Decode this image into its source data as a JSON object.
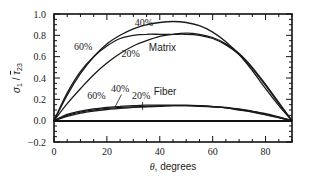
{
  "chart_data": {
    "type": "line",
    "title": "",
    "xlabel": "θ, degrees",
    "ylabel": "σ1/τ̄23",
    "xlim": [
      0,
      90
    ],
    "ylim": [
      -0.2,
      1.0
    ],
    "x_ticks": [
      0,
      20,
      40,
      60,
      80
    ],
    "y_ticks": [
      -0.2,
      0.0,
      0.2,
      0.4,
      0.6,
      0.8,
      1.0
    ],
    "y_tick_labels": [
      "−0.2",
      "0.0",
      "0.2",
      "0.4",
      "0.6",
      "0.8",
      "1.0"
    ],
    "grid": false,
    "legend": "inline labels",
    "x": [
      0,
      5,
      10,
      15,
      20,
      25,
      30,
      35,
      40,
      45,
      50,
      55,
      60,
      65,
      70,
      75,
      80,
      85,
      90
    ],
    "series": [
      {
        "name": "Matrix 40%",
        "group": "Matrix",
        "label": "40%",
        "values": [
          0.0,
          0.24,
          0.44,
          0.6,
          0.72,
          0.8,
          0.86,
          0.9,
          0.92,
          0.93,
          0.92,
          0.89,
          0.83,
          0.74,
          0.62,
          0.47,
          0.3,
          0.14,
          0.0
        ]
      },
      {
        "name": "Matrix 60%",
        "group": "Matrix",
        "label": "60%",
        "values": [
          0.0,
          0.26,
          0.46,
          0.6,
          0.7,
          0.77,
          0.8,
          0.81,
          0.81,
          0.81,
          0.81,
          0.8,
          0.77,
          0.71,
          0.62,
          0.49,
          0.33,
          0.16,
          0.0
        ]
      },
      {
        "name": "Matrix 20%",
        "group": "Matrix",
        "label": "20%",
        "values": [
          0.0,
          0.16,
          0.3,
          0.43,
          0.54,
          0.63,
          0.7,
          0.75,
          0.79,
          0.81,
          0.82,
          0.81,
          0.78,
          0.72,
          0.63,
          0.5,
          0.34,
          0.17,
          0.0
        ]
      },
      {
        "name": "Fiber 60%",
        "group": "Fiber",
        "label": "60%",
        "values": [
          0.0,
          0.06,
          0.09,
          0.11,
          0.125,
          0.135,
          0.14,
          0.145,
          0.145,
          0.145,
          0.145,
          0.14,
          0.13,
          0.12,
          0.105,
          0.085,
          0.06,
          0.03,
          0.0
        ]
      },
      {
        "name": "Fiber 40%",
        "group": "Fiber",
        "label": "40%",
        "values": [
          0.0,
          0.05,
          0.08,
          0.1,
          0.115,
          0.125,
          0.13,
          0.135,
          0.14,
          0.14,
          0.14,
          0.135,
          0.13,
          0.12,
          0.1,
          0.08,
          0.055,
          0.028,
          0.0
        ]
      },
      {
        "name": "Fiber 20%",
        "group": "Fiber",
        "label": "20%",
        "values": [
          0.0,
          0.04,
          0.07,
          0.09,
          0.105,
          0.115,
          0.125,
          0.13,
          0.135,
          0.14,
          0.14,
          0.14,
          0.135,
          0.125,
          0.11,
          0.09,
          0.065,
          0.035,
          0.0
        ]
      }
    ],
    "annotations": [
      {
        "text": "Matrix",
        "x": 41,
        "y": 0.65
      },
      {
        "text": "Fiber",
        "x": 42,
        "y": 0.24
      },
      {
        "text": "40%",
        "x": 34,
        "y": 0.89,
        "series": "Matrix 40%"
      },
      {
        "text": "60%",
        "x": 11,
        "y": 0.66,
        "series": "Matrix 60%"
      },
      {
        "text": "20%",
        "x": 29,
        "y": 0.6,
        "series": "Matrix 20%"
      },
      {
        "text": "60%",
        "x": 16,
        "y": 0.2,
        "series": "Fiber 60%"
      },
      {
        "text": "40%",
        "x": 25,
        "y": 0.27,
        "series": "Fiber 40%"
      },
      {
        "text": "20%",
        "x": 33,
        "y": 0.2,
        "series": "Fiber 20%"
      }
    ]
  },
  "colors": {
    "line": "#1a1a1a",
    "axis": "#111111",
    "background": "#ffffff"
  }
}
